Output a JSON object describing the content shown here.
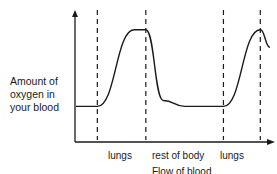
{
  "chart_data": {
    "type": "line",
    "title": "",
    "ylabel_lines": [
      "Amount of",
      "oxygen in",
      "your blood"
    ],
    "xlabel": "Flow of blood",
    "regions": [
      "lungs",
      "rest of body",
      "lungs"
    ],
    "series": [
      {
        "name": "oxygen level",
        "x": [
          0,
          0.11,
          0.3,
          0.36,
          0.45,
          0.56,
          0.76,
          0.95,
          1.0
        ],
        "values": [
          0.2,
          0.2,
          0.85,
          0.85,
          0.25,
          0.2,
          0.2,
          0.85,
          0.7
        ]
      }
    ],
    "dashed_lines_x": [
      0.11,
      0.36,
      0.76,
      0.95
    ],
    "ylim": [
      0,
      1
    ],
    "xlim": [
      0,
      1
    ]
  }
}
